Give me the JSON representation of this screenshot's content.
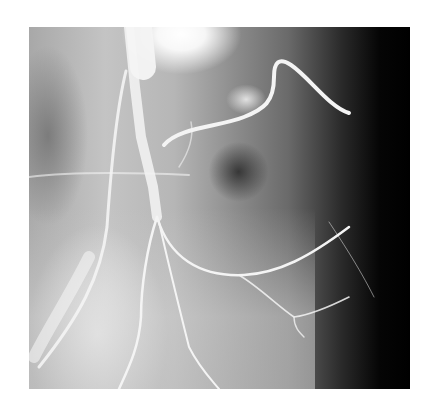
{
  "image": {
    "description": "Grayscale angiogram (X-ray with contrast-filled arteries) on white background",
    "frame": {
      "left": 29,
      "top": 27,
      "width": 381,
      "height": 362
    },
    "colors": {
      "background": "#ffffff",
      "vessel": "#f2f2f2",
      "dark_region": "#000000",
      "bright_region": "#ffffff"
    }
  }
}
